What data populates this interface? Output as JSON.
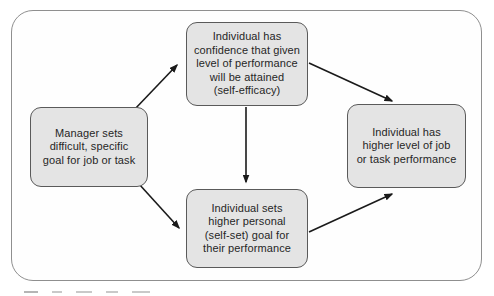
{
  "diagram": {
    "nodes": {
      "manager_goal": {
        "id": "manager-goal",
        "label": "Manager sets\ndifficult, specific\ngoal for job or task"
      },
      "self_efficacy": {
        "id": "self-efficacy",
        "label": "Individual has\nconfidence that given\nlevel of performance\nwill be attained\n(self-efficacy)"
      },
      "self_set_goal": {
        "id": "self-set-goal",
        "label": "Individual sets\nhigher personal\n(self-set) goal for\ntheir performance"
      },
      "performance": {
        "id": "performance",
        "label": "Individual has\nhigher level of job\nor task performance"
      }
    },
    "edges": [
      {
        "from": "manager-goal",
        "to": "self-efficacy"
      },
      {
        "from": "manager-goal",
        "to": "self-set-goal"
      },
      {
        "from": "self-efficacy",
        "to": "self-set-goal"
      },
      {
        "from": "self-efficacy",
        "to": "performance"
      },
      {
        "from": "self-set-goal",
        "to": "performance"
      }
    ],
    "colors": {
      "node_fill": "#e4e4e4",
      "node_border": "#5a5a5a",
      "frame_border": "#8f8f8f",
      "arrow": "#1a1a1a",
      "text": "#262626",
      "background": "#ffffff"
    }
  }
}
